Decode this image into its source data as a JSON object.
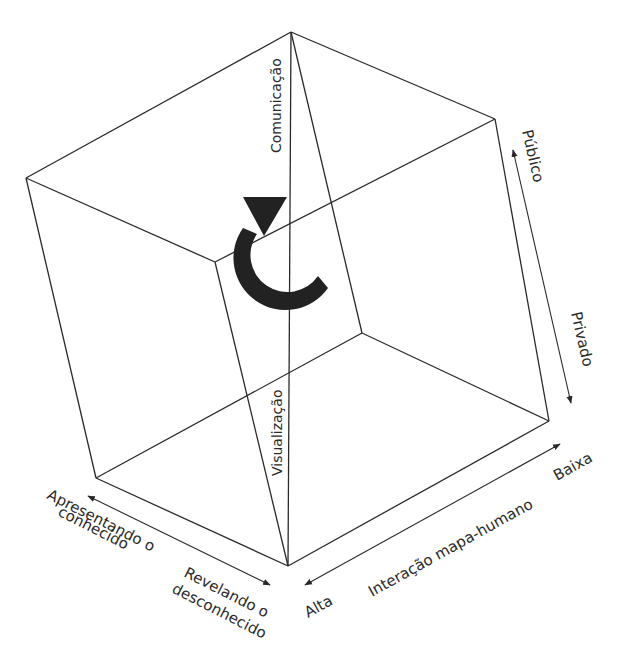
{
  "diagram": {
    "title": "",
    "cube_axes": {
      "vertical_axis": {
        "top_label": "Comunicação",
        "bottom_label": "Visualização"
      },
      "right_axis": {
        "top_label": "Público",
        "bottom_label": "Privado"
      },
      "left_axis": {
        "start_label_line1": "Apresentando o",
        "start_label_line2": "conhecido",
        "end_label_line1": "Revelando o",
        "end_label_line2": "desconhecido"
      },
      "bottom_axis": {
        "name": "Interação mapa-humano",
        "low_end_label": "Alta",
        "high_end_label": "Baixa"
      }
    },
    "rotation_indicator": "rotation-arrow",
    "colors": {
      "line": "#2a2a2a",
      "arrow_fill": "#222222",
      "background": "#ffffff"
    }
  }
}
